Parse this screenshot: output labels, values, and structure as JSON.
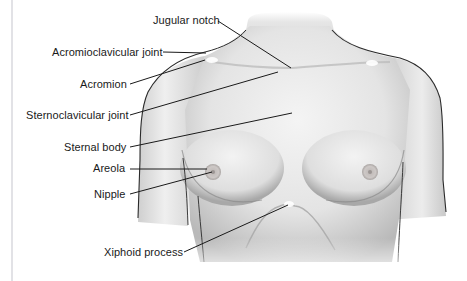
{
  "figure": {
    "type": "anatomical-diagram",
    "colors": {
      "skin_light": "#f2f2f2",
      "skin_mid": "#d9d9d9",
      "skin_shadow": "#9e9e9e",
      "outline": "#2a2a2a",
      "leader_line": "#1a1a1a",
      "label_text": "#1a1a1a",
      "areola": "#c8c4c2",
      "margin_rule": "#e2e2e6"
    },
    "labels": [
      {
        "id": "jugular-notch",
        "text": "Jugular notch"
      },
      {
        "id": "acromioclavicular-joint",
        "text": "Acromioclavicular joint"
      },
      {
        "id": "acromion",
        "text": "Acromion"
      },
      {
        "id": "sternoclavicular-joint",
        "text": "Sternoclavicular joint"
      },
      {
        "id": "sternal-body",
        "text": "Sternal body"
      },
      {
        "id": "areola",
        "text": "Areola"
      },
      {
        "id": "nipple",
        "text": "Nipple"
      },
      {
        "id": "xiphoid-process",
        "text": "Xiphoid process"
      }
    ]
  }
}
